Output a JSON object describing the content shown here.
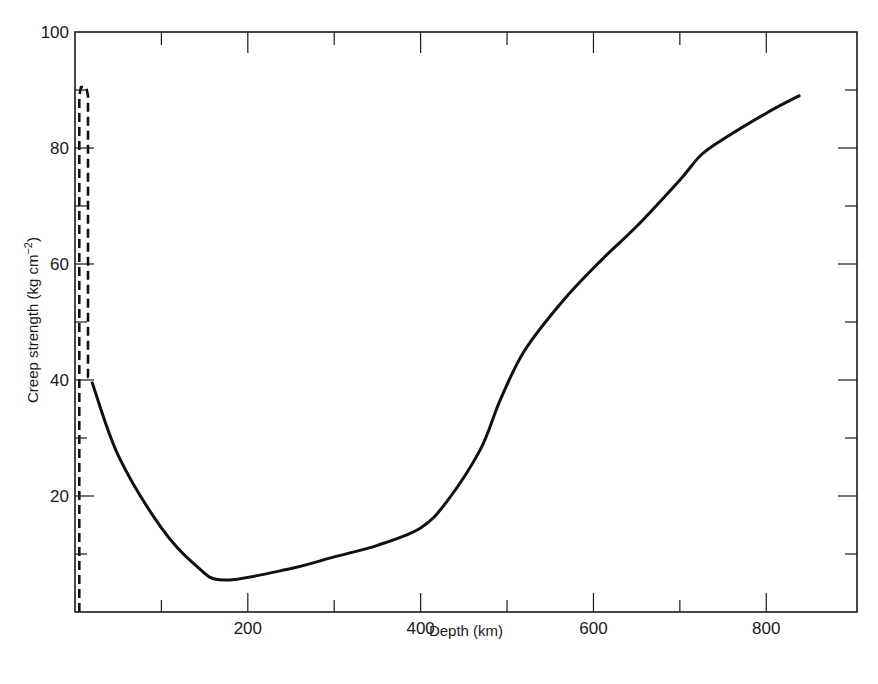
{
  "chart_data": {
    "type": "line",
    "title": "",
    "xlabel": "Depth (km)",
    "ylabel": "Creep strength (kg cm−2)",
    "ylabel_main": "Creep strength  (kg cm",
    "ylabel_sup": "−2",
    "ylabel_close": ")",
    "xlim": [
      0,
      905
    ],
    "ylim": [
      0,
      100
    ],
    "x_ticks_major": [
      200,
      400,
      600,
      800
    ],
    "x_ticks_minor": [
      100,
      300,
      500,
      700
    ],
    "x_tick_labels": [
      "200",
      "400",
      "600",
      "800"
    ],
    "y_ticks_major": [
      20,
      40,
      60,
      80,
      100
    ],
    "y_ticks_minor": [
      10,
      30,
      50,
      70,
      90
    ],
    "y_tick_labels": [
      "20",
      "40",
      "60",
      "80",
      "100"
    ],
    "grid": false,
    "legend": null,
    "series": [
      {
        "name": "Creep strength (solid)",
        "style": "solid",
        "x": [
          20,
          50,
          100,
          140,
          172,
          250,
          300,
          350,
          400,
          430,
          469,
          492,
          520,
          565,
          608,
          650,
          700,
          724,
          750,
          800,
          838
        ],
        "y": [
          39.5,
          27,
          14.5,
          8,
          5.5,
          7.5,
          9.5,
          11.5,
          14.5,
          19,
          28,
          36.5,
          45,
          53.7,
          60.5,
          66.5,
          74.5,
          78.7,
          81.5,
          86,
          89
        ]
      },
      {
        "name": "Upper-layer strength (dashed outline)",
        "style": "dashed",
        "x": [
          5,
          5,
          7,
          13,
          15,
          15,
          20
        ],
        "y": [
          0,
          89,
          90.5,
          90.5,
          89,
          40.5,
          40.5
        ]
      }
    ]
  }
}
